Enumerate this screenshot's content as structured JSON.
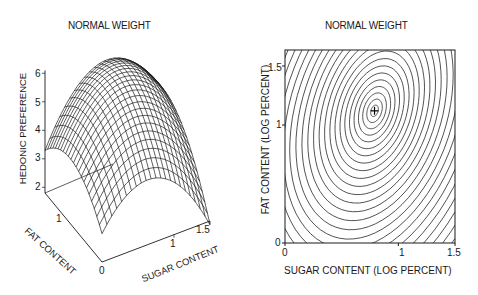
{
  "chart_data": [
    {
      "type": "surface3d",
      "title": "NORMAL WEIGHT",
      "xlabel": "SUGAR CONTENT",
      "ylabel": "FAT CONTENT",
      "zlabel": "HEDONIC PREFERENCE",
      "x_ticks": [
        "0",
        "1",
        "1.5"
      ],
      "y_ticks": [
        "1"
      ],
      "z_ticks": [
        "2",
        "3",
        "4",
        "5",
        "6"
      ],
      "xlim": [
        0,
        1.5
      ],
      "ylim": [
        0,
        1.6
      ],
      "zlim": [
        1.8,
        6.1
      ],
      "peak": {
        "sugar": 0.8,
        "fat": 1.1,
        "preference": 6.0
      },
      "corner_values": {
        "sugar0_fat0": 1.9,
        "sugar0_fatmax": 3.2,
        "sugarmax_fat0": 1.9,
        "sugarmax_fatmax": 3.5
      },
      "grid": "wireframe mesh"
    },
    {
      "type": "contour",
      "title": "NORMAL WEIGHT",
      "xlabel": "SUGAR CONTENT (LOG PERCENT)",
      "ylabel": "FAT CONTENT (LOG PERCENT)",
      "x_ticks": [
        "0",
        "1",
        "1.5"
      ],
      "y_ticks": [
        "0",
        "1",
        "1.5"
      ],
      "xlim": [
        0,
        1.5
      ],
      "ylim": [
        0,
        1.65
      ],
      "optimum_marker": {
        "symbol": "+",
        "sugar": 0.79,
        "fat": 1.12
      },
      "contour_levels": 28
    }
  ],
  "left": {
    "title": "NORMAL WEIGHT",
    "zlabel": "HEDONIC PREFERENCE",
    "ylabel": "FAT CONTENT",
    "xlabel": "SUGAR CONTENT",
    "z_ticks": [
      "6",
      "5",
      "4",
      "3",
      "2"
    ],
    "fat_tick": "1",
    "sugar_ticks": [
      "0",
      "1",
      "1.5"
    ]
  },
  "right": {
    "title": "NORMAL WEIGHT",
    "ylabel": "FAT CONTENT (LOG PERCENT)",
    "xlabel": "SUGAR CONTENT (LOG PERCENT)",
    "y_ticks": [
      "1.5",
      "1",
      "0"
    ],
    "x_ticks": [
      "0",
      "1",
      "1.5"
    ],
    "marker": "+"
  }
}
